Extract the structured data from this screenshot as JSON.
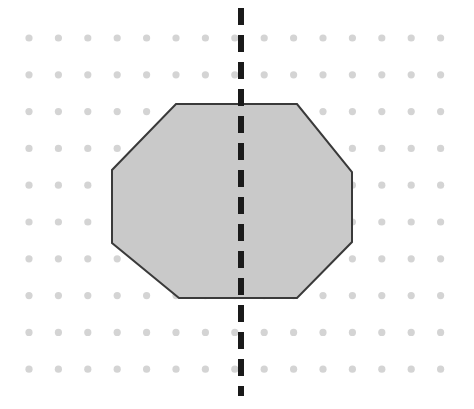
{
  "figure": {
    "canvas": {
      "width": 474,
      "height": 409,
      "background": "#ffffff"
    },
    "dot_grid": {
      "name": "dot-grid",
      "columns": 15,
      "rows": 10,
      "origin_x": 29,
      "origin_y": 38,
      "spacing_x": 29.4,
      "spacing_y": 36.8,
      "dot_radius": 3.6,
      "color": "#d4d4d4"
    },
    "shape": {
      "name": "octagon",
      "sides": 8,
      "fill": "#c9c9c9",
      "stroke": "#3a3a3a",
      "stroke_width": 2,
      "points": "176,104 297,104 352,172 352,242 297,298 179,298 112,243 112,170",
      "vertices": [
        {
          "label": "top-left",
          "x": 176,
          "y": 104
        },
        {
          "label": "top-right",
          "x": 297,
          "y": 104
        },
        {
          "label": "right-upper",
          "x": 352,
          "y": 172
        },
        {
          "label": "right-lower",
          "x": 352,
          "y": 242
        },
        {
          "label": "bottom-right",
          "x": 297,
          "y": 298
        },
        {
          "label": "bottom-left",
          "x": 179,
          "y": 298
        },
        {
          "label": "left-lower",
          "x": 112,
          "y": 243
        },
        {
          "label": "left-upper",
          "x": 112,
          "y": 170
        }
      ]
    },
    "symmetry_line": {
      "name": "line-of-symmetry",
      "orientation": "vertical",
      "x": 241,
      "y_start": 8,
      "y_end": 396,
      "color": "#1a1a1a",
      "width": 6,
      "dash": 17,
      "gap": 10
    }
  }
}
